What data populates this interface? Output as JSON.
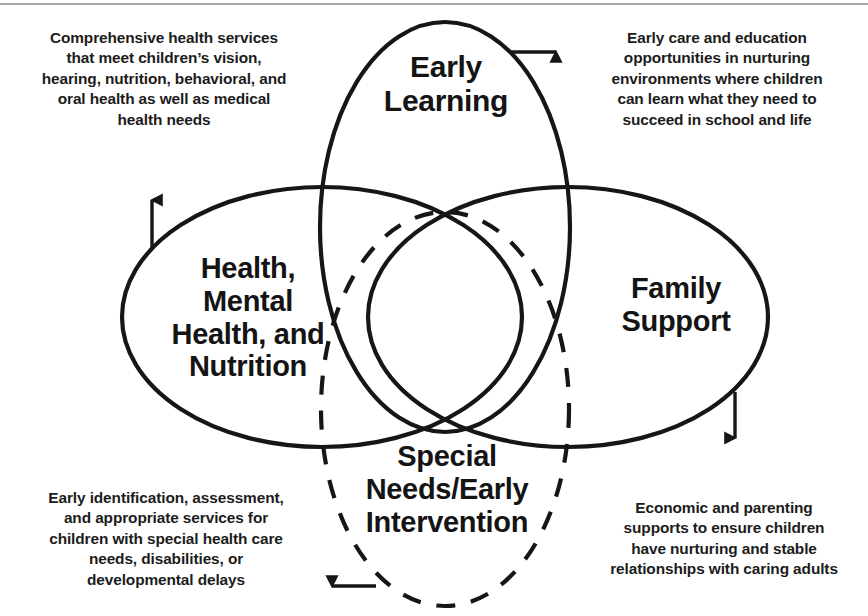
{
  "diagram": {
    "type": "venn",
    "stroke_color": "#161616",
    "background_color": "#ffffff",
    "accent_rule_color": "#8d8d8d",
    "circles": [
      {
        "id": "early-learning",
        "label_lines": [
          "Early",
          "Learning"
        ],
        "style": "solid",
        "orientation": "vertical-ellipse"
      },
      {
        "id": "health-mental-health-nutrition",
        "label_lines": [
          "Health,",
          "Mental",
          "Health, and",
          "Nutrition"
        ],
        "style": "solid",
        "orientation": "horizontal-ellipse"
      },
      {
        "id": "family-support",
        "label_lines": [
          "Family",
          "Support"
        ],
        "style": "solid",
        "orientation": "horizontal-ellipse"
      },
      {
        "id": "special-needs-early-intervention",
        "label_lines": [
          "Special",
          "Needs/Early",
          "Intervention"
        ],
        "style": "dashed",
        "orientation": "vertical-ellipse"
      }
    ],
    "callouts": [
      {
        "id": "health-callout",
        "for": "health-mental-health-nutrition",
        "arrow": "up",
        "text": "Comprehensive health services that meet children’s vision, hearing, nutrition, behavioral, and oral health as well as medical health needs",
        "lines": [
          "Comprehensive health services",
          "that meet children’s vision,",
          "hearing, nutrition, behavioral, and",
          "oral health as well as medical",
          "health needs"
        ]
      },
      {
        "id": "early-learning-callout",
        "for": "early-learning",
        "arrow": "right",
        "text": "Early care and education opportunities in nurturing environments where children can learn what they need to succeed in school and life",
        "lines": [
          "Early care and education",
          "opportunities in nurturing",
          "environments where children",
          "can learn what they need to",
          "succeed in school and life"
        ]
      },
      {
        "id": "special-needs-callout",
        "for": "special-needs-early-intervention",
        "arrow": "left",
        "text": "Early identification, assessment, and appropriate services for children with special health care needs, disabilities, or developmental delays",
        "lines": [
          "Early identification, assessment,",
          "and appropriate services for",
          "children with special health care",
          "needs, disabilities, or",
          "developmental delays"
        ]
      },
      {
        "id": "family-support-callout",
        "for": "family-support",
        "arrow": "down",
        "text": "Economic and parenting supports to ensure children have nurturing and stable relationships with caring adults",
        "lines": [
          "Economic and parenting",
          "supports to ensure children",
          "have nurturing and stable",
          "relationships with caring adults"
        ]
      }
    ],
    "arrows": [
      {
        "id": "arrow-up-health",
        "direction": "up"
      },
      {
        "id": "arrow-right-early-learning",
        "direction": "right"
      },
      {
        "id": "arrow-left-special-needs",
        "direction": "left"
      },
      {
        "id": "arrow-down-family-support",
        "direction": "down"
      }
    ]
  }
}
